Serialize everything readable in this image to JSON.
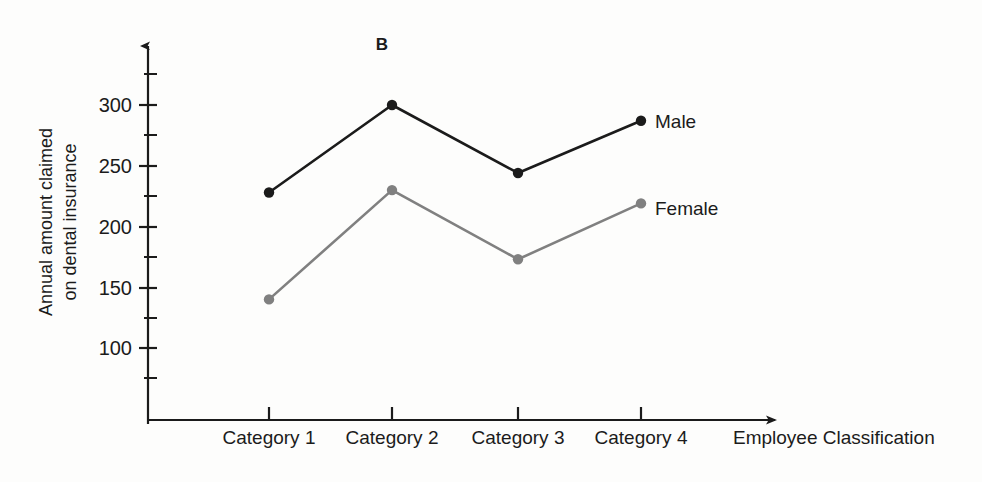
{
  "figure": {
    "panel_label": "B",
    "background_color": "#fdfdfc"
  },
  "chart_data": {
    "type": "line",
    "title": "B",
    "xlabel": "Employee Classification",
    "ylabel": "Annual amount claimed on dental insurance",
    "ylabel_line1": "Annual amount claimed",
    "ylabel_line2": "on dental insurance",
    "categories": [
      "Category 1",
      "Category 2",
      "Category 3",
      "Category 4"
    ],
    "series": [
      {
        "name": "Male",
        "color": "#1b1b1b",
        "values": [
          228,
          300,
          244,
          287
        ]
      },
      {
        "name": "Female",
        "color": "#808080",
        "values": [
          140,
          230,
          173,
          219
        ]
      }
    ],
    "ylim": [
      60,
      340
    ],
    "y_major_ticks": [
      100,
      150,
      200,
      250,
      300
    ],
    "y_major_tick_labels": [
      "100",
      "150",
      "200",
      "250",
      "300"
    ],
    "y_minor_ticks": [
      125,
      175,
      225,
      275,
      325
    ],
    "grid": false,
    "legend_position": "inline-right-of-last-point",
    "axis_style": "arrow-terminated"
  },
  "axis": {
    "y_tick_labels": [
      "300",
      "250",
      "200",
      "150",
      "100"
    ],
    "x_axis_title": "Employee Classification",
    "x_tick_labels": [
      "Category 1",
      "Category 2",
      "Category 3",
      "Category 4"
    ]
  },
  "legend": {
    "male_label": "Male",
    "female_label": "Female"
  }
}
